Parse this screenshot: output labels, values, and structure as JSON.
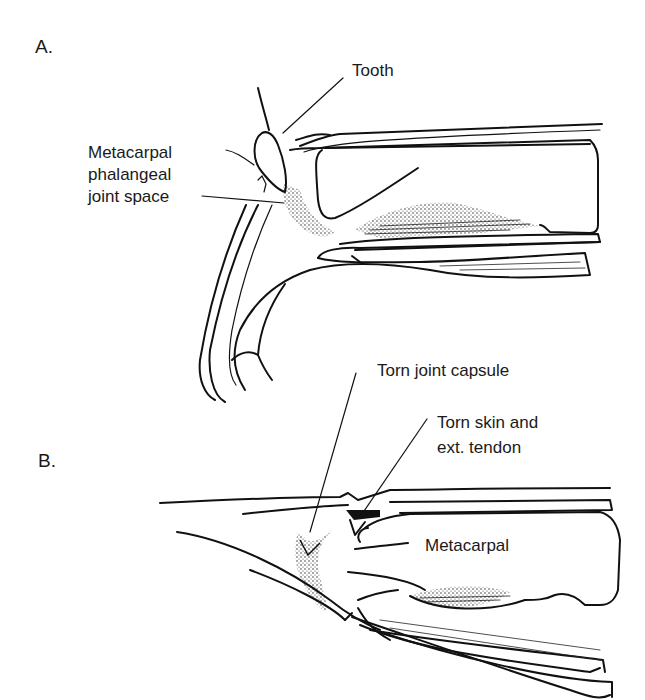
{
  "figure": {
    "panel_a": {
      "label": "A.",
      "labels": {
        "tooth": "Tooth",
        "joint_space": [
          "Metacarpal",
          "phalangeal",
          "joint space"
        ]
      }
    },
    "panel_b": {
      "label": "B.",
      "labels": {
        "torn_capsule": "Torn joint capsule",
        "torn_skin": [
          "Torn skin and",
          "ext. tendon"
        ],
        "metacarpal": "Metacarpal"
      }
    }
  }
}
